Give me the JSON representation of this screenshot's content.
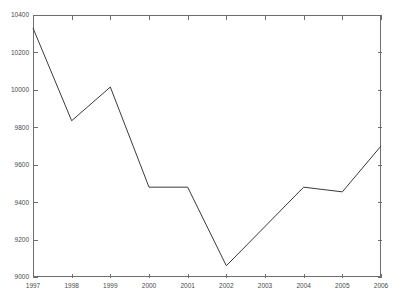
{
  "chart_data": {
    "type": "line",
    "title": "",
    "xlabel": "",
    "ylabel": "",
    "x": [
      1997,
      1998,
      1999,
      2000,
      2001,
      2002,
      2003,
      2004,
      2005,
      2006
    ],
    "categories": [
      "1997",
      "1998",
      "1999",
      "2000",
      "2001",
      "2002",
      "2003",
      "2004",
      "2005",
      "2006"
    ],
    "values": [
      10330,
      9835,
      10015,
      9480,
      9480,
      9060,
      9270,
      9480,
      9455,
      9700
    ],
    "series": [
      {
        "name": "series-1",
        "values": [
          10330,
          9835,
          10015,
          9480,
          9480,
          9060,
          9270,
          9480,
          9455,
          9700
        ],
        "color": "#3a3a3a"
      }
    ],
    "vertices": [
      {
        "x": 1997,
        "y": 10330
      },
      {
        "x": 1998,
        "y": 9835
      },
      {
        "x": 1999,
        "y": 10015
      },
      {
        "x": 2000,
        "y": 9480
      },
      {
        "x": 2001,
        "y": 9480
      },
      {
        "x": 2002,
        "y": 9060
      },
      {
        "x": 2004,
        "y": 9480
      },
      {
        "x": 2005,
        "y": 9455
      },
      {
        "x": 2006,
        "y": 9700
      }
    ],
    "xlim": [
      1997,
      2006
    ],
    "ylim": [
      9000,
      10400
    ],
    "ytick_values": [
      9000,
      9200,
      9400,
      9600,
      9800,
      10000,
      10200,
      10400
    ],
    "ytick_labels": [
      "9000",
      "9200",
      "9400",
      "9600",
      "9800",
      "10000",
      "10200",
      "10400"
    ],
    "xtick_values": [
      1997,
      1998,
      1999,
      2000,
      2001,
      2002,
      2003,
      2004,
      2005,
      2006
    ],
    "xtick_labels": [
      "1997",
      "1998",
      "1999",
      "2000",
      "2001",
      "2002",
      "2003",
      "2004",
      "2005",
      "2006"
    ],
    "grid": false,
    "legend": null,
    "legend_position": "none",
    "annotations": [],
    "background_color": "#ffffff",
    "axis_color": "#6e6e6e",
    "line_color": "#3a3a3a",
    "tick_label_color": "#4a4a4a"
  },
  "plot_box": {
    "left": 33,
    "right": 381,
    "top": 15,
    "bottom": 277
  }
}
